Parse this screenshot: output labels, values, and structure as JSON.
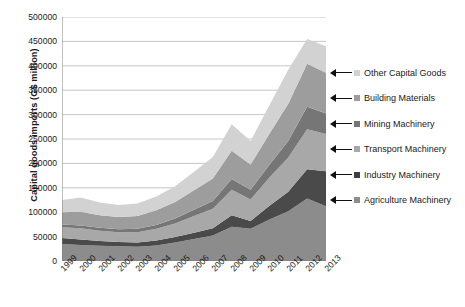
{
  "chart_data": {
    "type": "area",
    "stacked": true,
    "title": "",
    "subtitle": "",
    "xlabel": "",
    "ylabel": "Capital goods imports (G$ million)",
    "categories": [
      "1999",
      "2000",
      "2001",
      "2002",
      "2003",
      "2004",
      "2005",
      "2006",
      "2007",
      "2008",
      "2009",
      "2010",
      "2011",
      "2012",
      "2013"
    ],
    "x": [
      1999,
      2000,
      2001,
      2002,
      2003,
      2004,
      2005,
      2006,
      2007,
      2008,
      2009,
      2010,
      2011,
      2012,
      2013
    ],
    "ylim": [
      0,
      500000
    ],
    "ytick_labels": [
      "0",
      "50000",
      "100000",
      "150000",
      "200000",
      "250000",
      "300000",
      "350000",
      "400000",
      "450000",
      "500000"
    ],
    "ytick_values": [
      0,
      50000,
      100000,
      150000,
      200000,
      250000,
      300000,
      350000,
      400000,
      450000,
      500000
    ],
    "grid": "horizontal",
    "legend_position": "right",
    "series": [
      {
        "name": "Agriculture Machinery",
        "color": "#8c8c8c",
        "values": [
          35000,
          33000,
          31000,
          30000,
          29000,
          32000,
          38000,
          45000,
          52000,
          70000,
          66000,
          85000,
          102000,
          128000,
          112000
        ]
      },
      {
        "name": "Industry Machinery",
        "color": "#4a4a4a",
        "values": [
          12000,
          11000,
          10000,
          9000,
          9000,
          10000,
          11000,
          13000,
          15000,
          24000,
          16000,
          28000,
          40000,
          60000,
          72000
        ]
      },
      {
        "name": "Transport Machinery",
        "color": "#a8a8a8",
        "values": [
          22000,
          23000,
          21000,
          20000,
          21000,
          24000,
          28000,
          34000,
          40000,
          52000,
          44000,
          58000,
          70000,
          82000,
          76000
        ]
      },
      {
        "name": "Mining Machinery",
        "color": "#767676",
        "values": [
          6000,
          6000,
          6000,
          6000,
          7000,
          8000,
          10000,
          13000,
          16000,
          22000,
          20000,
          26000,
          34000,
          46000,
          42000
        ]
      },
      {
        "name": "Building Materials",
        "color": "#9d9d9d",
        "values": [
          25000,
          28000,
          26000,
          25000,
          26000,
          30000,
          34000,
          40000,
          46000,
          58000,
          52000,
          64000,
          76000,
          88000,
          84000
        ]
      },
      {
        "name": "Other Capital Goods",
        "color": "#d2d2d2",
        "values": [
          25000,
          29000,
          26000,
          25000,
          26000,
          28000,
          32000,
          38000,
          44000,
          54000,
          48000,
          58000,
          70000,
          51000,
          54000
        ]
      }
    ]
  },
  "legend": {
    "items": [
      {
        "label": "Other Capital Goods",
        "color": "#d2d2d2"
      },
      {
        "label": "Building Materials",
        "color": "#9d9d9d"
      },
      {
        "label": "Mining Machinery",
        "color": "#767676"
      },
      {
        "label": "Transport Machinery",
        "color": "#a8a8a8"
      },
      {
        "label": "Industry Machinery",
        "color": "#3f3f3f"
      },
      {
        "label": "Agriculture Machinery",
        "color": "#8c8c8c"
      }
    ]
  }
}
